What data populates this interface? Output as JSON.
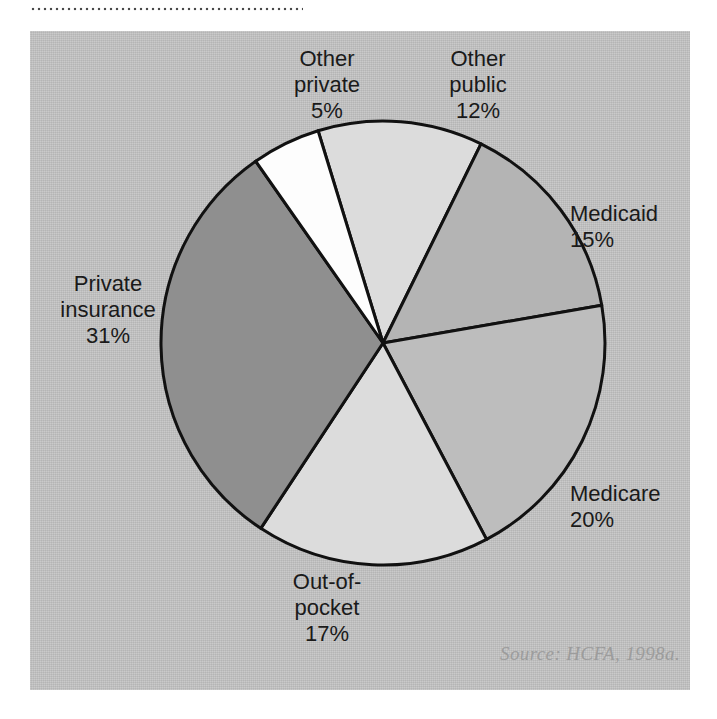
{
  "page": {
    "background_color": "#ffffff",
    "panel_color": "#c4c4c4",
    "divider": "dotted-rule"
  },
  "source_note": "Source: HCFA, 1998a.",
  "labels": {
    "other_private": {
      "name": "Other\nprivate",
      "pct": "5%"
    },
    "other_public": {
      "name": "Other\npublic",
      "pct": "12%"
    },
    "medicaid": {
      "name": "Medicaid",
      "pct": "15%"
    },
    "medicare": {
      "name": "Medicare",
      "pct": "20%"
    },
    "out_of_pocket": {
      "name": "Out-of-\npocket",
      "pct": "17%"
    },
    "private_insurance": {
      "name": "Private\ninsurance",
      "pct": "31%"
    }
  },
  "chart_data": {
    "type": "pie",
    "title": "",
    "subtitle": "",
    "xlabel": "",
    "ylabel": "",
    "grid": false,
    "legend_position": "labels-around-slices",
    "units": "percent",
    "start_angle_deg": -17,
    "direction": "clockwise",
    "center": {
      "cx": 353,
      "cy": 312
    },
    "radius": 222,
    "stroke_color": "#111111",
    "stroke_width": 3,
    "source": "Source: HCFA, 1998a.",
    "categories": [
      "Other public",
      "Medicaid",
      "Medicare",
      "Out-of-pocket",
      "Private insurance",
      "Other private"
    ],
    "values": [
      12,
      15,
      20,
      17,
      31,
      5
    ],
    "slices": [
      {
        "label": "Other public",
        "value": 12,
        "display": "12%",
        "color": "#dcdcdc"
      },
      {
        "label": "Medicaid",
        "value": 15,
        "display": "15%",
        "color": "#b4b4b4"
      },
      {
        "label": "Medicare",
        "value": 20,
        "display": "20%",
        "color": "#bdbdbd"
      },
      {
        "label": "Out-of-pocket",
        "value": 17,
        "display": "17%",
        "color": "#dcdcdc"
      },
      {
        "label": "Private insurance",
        "value": 31,
        "display": "31%",
        "color": "#8f8f8f"
      },
      {
        "label": "Other private",
        "value": 5,
        "display": "5%",
        "color": "#fdfdfd"
      }
    ]
  }
}
